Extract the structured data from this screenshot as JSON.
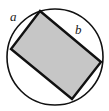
{
  "figure": {
    "background_color": "#ffffff",
    "stroke_color": "#111111",
    "fill_color": "#c6c6c6",
    "circle": {
      "name": "circumscribed-circle",
      "center_x": 55,
      "center_y": 57,
      "radius": 48,
      "stroke_width": 1.6,
      "fill": "none"
    },
    "rectangle": {
      "name": "inscribed-rectangle",
      "fill": "#c6c6c6",
      "stroke_width": 2.4,
      "rotation_degrees": 39,
      "vertices": [
        {
          "name": "top-vertex",
          "x": 40,
          "y": 11
        },
        {
          "name": "right-vertex",
          "x": 101,
          "y": 62
        },
        {
          "name": "bottom-vertex",
          "x": 72,
          "y": 99
        },
        {
          "name": "left-vertex",
          "x": 11,
          "y": 49
        }
      ]
    },
    "labels": [
      {
        "name": "side-a-label",
        "text": "a",
        "side": "short",
        "x": 10,
        "y": 10
      },
      {
        "name": "side-b-label",
        "text": "b",
        "side": "long",
        "x": 75,
        "y": 23
      }
    ]
  }
}
